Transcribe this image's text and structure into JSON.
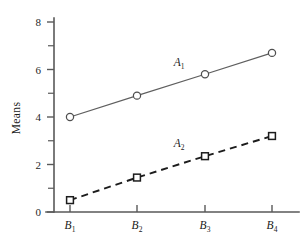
{
  "chart_data": {
    "type": "line",
    "title": "",
    "xlabel": "",
    "ylabel": "Means",
    "categories": [
      "B1",
      "B2",
      "B3",
      "B4"
    ],
    "category_labels": [
      {
        "base": "B",
        "sub": "1"
      },
      {
        "base": "B",
        "sub": "2"
      },
      {
        "base": "B",
        "sub": "3"
      },
      {
        "base": "B",
        "sub": "4"
      }
    ],
    "ylim": [
      0,
      8
    ],
    "y_ticks_major": [
      0,
      2,
      4,
      6,
      8
    ],
    "y_tick_labels": [
      "0",
      "2",
      "4",
      "6",
      "8"
    ],
    "y_ticks_minor": [
      1,
      3,
      5,
      7
    ],
    "grid": false,
    "legend_position": "inline-annotation",
    "series": [
      {
        "name": "A1",
        "label_base": "A",
        "label_sub": "1",
        "values": [
          4.0,
          4.9,
          5.8,
          6.7
        ],
        "line_style": "solid",
        "marker": "circle",
        "color": "#5f5f5f",
        "label_x_category_fraction": 1.62,
        "label_value": 6.15
      },
      {
        "name": "A2",
        "label_base": "A",
        "label_sub": "2",
        "values": [
          0.5,
          1.45,
          2.35,
          3.2
        ],
        "line_style": "dashed",
        "marker": "square",
        "color": "#1c1c1c",
        "label_x_category_fraction": 1.62,
        "label_value": 2.72
      }
    ]
  },
  "colors": {
    "background": "#ffffff",
    "axis": "#595959",
    "series_a1": "#5f5f5f",
    "series_a2": "#1c1c1c",
    "text": "#1a1a1a"
  }
}
